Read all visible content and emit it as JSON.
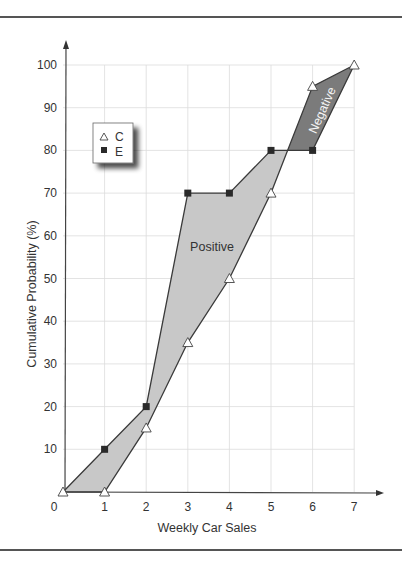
{
  "chart_data": {
    "type": "line",
    "title": "",
    "xlabel": "Weekly Car Sales",
    "ylabel": "Cumulative Probability (%)",
    "x_ticks": [
      "0",
      "1",
      "2",
      "3",
      "4",
      "5",
      "6",
      "7"
    ],
    "y_ticks": [
      "10",
      "20",
      "30",
      "40",
      "50",
      "60",
      "70",
      "80",
      "90",
      "100"
    ],
    "xlim": [
      0,
      7
    ],
    "ylim": [
      0,
      100
    ],
    "grid": true,
    "legend_position": "upper-left",
    "series": [
      {
        "name": "C",
        "marker": "open-triangle",
        "x": [
          0,
          1,
          2,
          3,
          4,
          5,
          6,
          7
        ],
        "values": [
          0,
          0,
          15,
          35,
          50,
          70,
          95,
          100
        ]
      },
      {
        "name": "E",
        "marker": "filled-square",
        "x": [
          0,
          1,
          2,
          3,
          4,
          5,
          6,
          7
        ],
        "values": [
          0,
          10,
          20,
          70,
          70,
          80,
          80,
          100
        ]
      }
    ],
    "annotations": [
      {
        "text": "Positive",
        "region": "E above C (x 0 to ~5.4)",
        "fill": "#c8c8c8"
      },
      {
        "text": "Negative",
        "region": "C above E (x ~5.4 to 7)",
        "fill": "#7b7b7b"
      }
    ]
  },
  "legend": {
    "items": [
      {
        "label": "C",
        "icon": "open-triangle"
      },
      {
        "label": "E",
        "icon": "filled-square"
      }
    ]
  },
  "labels": {
    "positive": "Positive",
    "negative": "Negative",
    "x_axis": "Weekly Car Sales",
    "y_axis": "Cumulative Probability (%)",
    "origin": "0"
  },
  "colors": {
    "positive_fill": "#c8c8c8",
    "negative_fill": "#7b7b7b",
    "line": "#3a3a3a",
    "grid": "#dcdcdc",
    "marker_square": "#2a2a2a"
  }
}
